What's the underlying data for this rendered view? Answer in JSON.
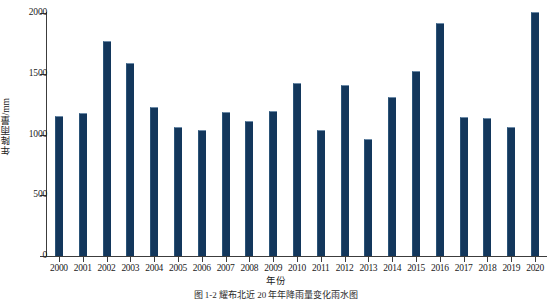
{
  "chart_data": {
    "type": "bar",
    "title": "",
    "xlabel": "年份",
    "ylabel": "年降雨量/mm",
    "categories": [
      "2000",
      "2001",
      "2002",
      "2003",
      "2004",
      "2005",
      "2006",
      "2007",
      "2008",
      "2009",
      "2010",
      "2011",
      "2012",
      "2013",
      "2014",
      "2015",
      "2016",
      "2017",
      "2018",
      "2019",
      "2020"
    ],
    "values": [
      1150,
      1180,
      1770,
      1585,
      1230,
      1060,
      1040,
      1185,
      1110,
      1190,
      1425,
      1040,
      1410,
      960,
      1310,
      1525,
      1920,
      1140,
      1135,
      1065,
      2005
    ],
    "series": [
      {
        "name": "年降雨量",
        "values": [
          1150,
          1180,
          1770,
          1585,
          1230,
          1060,
          1040,
          1185,
          1110,
          1190,
          1425,
          1040,
          1410,
          960,
          1310,
          1525,
          1920,
          1140,
          1135,
          1065,
          2005
        ]
      }
    ],
    "ylim": [
      0,
      2000
    ],
    "yticks": [
      0,
      500,
      1000,
      1500,
      2000
    ],
    "ytick_labels": [
      "0",
      "500",
      "1000",
      "1500",
      "2000"
    ],
    "grid": false,
    "legend": "none",
    "bar_color": "#13375c",
    "bar_edge_color": "#6d8ba8",
    "axis_color": "#3c3c3c"
  },
  "caption": "图 1-2    耀布北近 20 年年降雨量变化雨水图"
}
